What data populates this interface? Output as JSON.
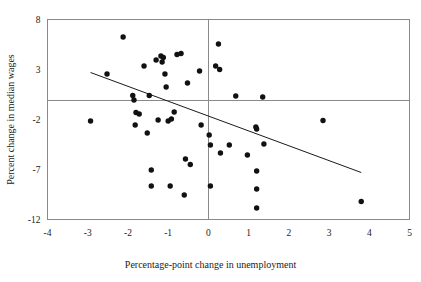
{
  "chart_data": {
    "type": "scatter",
    "title": "",
    "xlabel": "Percentage-point change in unemployment",
    "ylabel": "Percent change in median wages",
    "xlim": [
      -4,
      5
    ],
    "ylim": [
      -12,
      8
    ],
    "xticks": [
      -4,
      -3,
      -2,
      -1,
      0,
      1,
      2,
      3,
      4,
      5
    ],
    "xtick_labels": [
      "-4",
      "-3",
      "-2",
      "-1",
      "0",
      "1",
      "2",
      "3",
      "4",
      "5"
    ],
    "yticks": [
      -12,
      -7,
      -2,
      3,
      8
    ],
    "ytick_labels": [
      "-12",
      "-7",
      "-2",
      "3",
      "8"
    ],
    "grid": false,
    "legend": null,
    "reference_lines": {
      "horizontal_at_y": 0,
      "vertical_at_x": 0
    },
    "trendline": {
      "type": "linear-fit",
      "x_start": -2.93,
      "y_start": 2.7,
      "x_end": 3.8,
      "y_end": -7.3
    },
    "points": [
      {
        "x": -2.93,
        "y": -2.15
      },
      {
        "x": -2.52,
        "y": 2.55
      },
      {
        "x": -2.12,
        "y": 6.25
      },
      {
        "x": -1.88,
        "y": 0.4
      },
      {
        "x": -1.85,
        "y": -0.05
      },
      {
        "x": -1.82,
        "y": -2.55
      },
      {
        "x": -1.8,
        "y": -1.3
      },
      {
        "x": -1.72,
        "y": -1.45
      },
      {
        "x": -1.6,
        "y": 3.35
      },
      {
        "x": -1.52,
        "y": -3.35
      },
      {
        "x": -1.47,
        "y": 0.4
      },
      {
        "x": -1.42,
        "y": -7.05
      },
      {
        "x": -1.42,
        "y": -8.65
      },
      {
        "x": -1.3,
        "y": 3.95
      },
      {
        "x": -1.25,
        "y": -2.05
      },
      {
        "x": -1.18,
        "y": 4.35
      },
      {
        "x": -1.15,
        "y": 3.75
      },
      {
        "x": -1.12,
        "y": 4.2
      },
      {
        "x": -1.08,
        "y": 2.55
      },
      {
        "x": -1.05,
        "y": 1.25
      },
      {
        "x": -1.0,
        "y": -2.15
      },
      {
        "x": -0.95,
        "y": -8.65
      },
      {
        "x": -0.92,
        "y": -1.95
      },
      {
        "x": -0.85,
        "y": -1.25
      },
      {
        "x": -0.78,
        "y": 4.5
      },
      {
        "x": -0.68,
        "y": 4.6
      },
      {
        "x": -0.6,
        "y": -9.55
      },
      {
        "x": -0.57,
        "y": -5.95
      },
      {
        "x": -0.52,
        "y": 1.65
      },
      {
        "x": -0.45,
        "y": -6.5
      },
      {
        "x": -0.22,
        "y": 2.85
      },
      {
        "x": -0.18,
        "y": -2.55
      },
      {
        "x": 0.02,
        "y": -3.55
      },
      {
        "x": 0.05,
        "y": -4.55
      },
      {
        "x": 0.05,
        "y": -8.65
      },
      {
        "x": 0.18,
        "y": 3.35
      },
      {
        "x": 0.25,
        "y": 5.55
      },
      {
        "x": 0.28,
        "y": 3.0
      },
      {
        "x": 0.3,
        "y": -5.35
      },
      {
        "x": 0.52,
        "y": -4.55
      },
      {
        "x": 0.68,
        "y": 0.35
      },
      {
        "x": 0.97,
        "y": -5.55
      },
      {
        "x": 1.18,
        "y": -2.75
      },
      {
        "x": 1.2,
        "y": -2.95
      },
      {
        "x": 1.2,
        "y": -7.15
      },
      {
        "x": 1.2,
        "y": -8.95
      },
      {
        "x": 1.2,
        "y": -10.85
      },
      {
        "x": 1.35,
        "y": 0.25
      },
      {
        "x": 1.38,
        "y": -4.45
      },
      {
        "x": 2.85,
        "y": -2.1
      },
      {
        "x": 3.8,
        "y": -10.2
      }
    ]
  },
  "icons": {
    "point_marker": "filled-circle-marker"
  }
}
